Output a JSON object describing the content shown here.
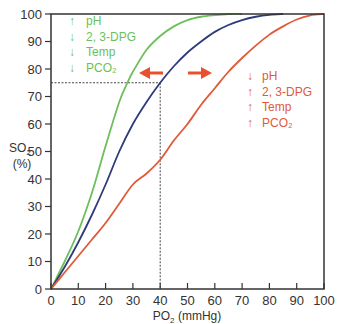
{
  "chart_data": {
    "type": "line",
    "title": "",
    "xlabel": "PO2 (mmHg)",
    "ylabel": "SO2 (%)",
    "xlim": [
      0,
      100
    ],
    "ylim": [
      0,
      100
    ],
    "xticks": [
      0,
      10,
      20,
      30,
      40,
      50,
      60,
      70,
      80,
      90,
      100
    ],
    "yticks": [
      0,
      10,
      20,
      30,
      40,
      50,
      60,
      70,
      80,
      90,
      100
    ],
    "grid": false,
    "legend": "none",
    "series": [
      {
        "name": "Left-shifted curve",
        "color": "#6cbf5a",
        "x": [
          0,
          5,
          10,
          15,
          20,
          25,
          28,
          30,
          35,
          40,
          45,
          50,
          55,
          60,
          65,
          70
        ],
        "y": [
          0,
          10,
          21,
          35,
          52,
          68,
          75,
          79,
          87,
          92,
          95.5,
          97.8,
          99,
          99.6,
          100,
          100
        ]
      },
      {
        "name": "Normal curve",
        "color": "#2e3a7a",
        "x": [
          0,
          5,
          10,
          15,
          20,
          25,
          30,
          35,
          40,
          45,
          50,
          55,
          60,
          65,
          70,
          75,
          80,
          85
        ],
        "y": [
          0,
          8,
          17,
          27,
          38,
          50,
          60,
          68,
          75,
          81,
          86,
          90,
          93.5,
          96,
          97.8,
          99,
          99.7,
          100
        ]
      },
      {
        "name": "Right-shifted curve",
        "color": "#e05a3a",
        "x": [
          0,
          5,
          10,
          15,
          20,
          25,
          30,
          35,
          40,
          45,
          50,
          55,
          60,
          65,
          70,
          75,
          80,
          85,
          90,
          95,
          100
        ],
        "y": [
          0,
          6,
          12,
          18,
          24,
          31,
          38,
          42,
          47,
          54,
          60,
          67,
          73,
          79,
          84,
          88.5,
          92.5,
          95.5,
          98,
          99.5,
          100
        ]
      }
    ],
    "annotations": {
      "reference_line": {
        "x": 40,
        "y": 75,
        "style": "dotted"
      },
      "left_shift": {
        "color": "#6cbf5a",
        "items": [
          {
            "arrow": "↑",
            "label": "pH"
          },
          {
            "arrow": "↓",
            "label": "2, 3-DPG"
          },
          {
            "arrow": "↓",
            "label": "Temp"
          },
          {
            "arrow": "↓",
            "label": "PCO₂"
          }
        ]
      },
      "right_shift": {
        "color": "#e05a3a",
        "items": [
          {
            "arrow": "↓",
            "label": "pH"
          },
          {
            "arrow": "↑",
            "label": "2, 3-DPG"
          },
          {
            "arrow": "↑",
            "label": "Temp"
          },
          {
            "arrow": "↑",
            "label": "PCO₂"
          }
        ]
      },
      "shift_arrows": {
        "color": "#e8502e",
        "left": "←",
        "right": "→"
      }
    }
  },
  "labels": {
    "x_axis_main": "PO",
    "x_axis_sub": "2",
    "x_axis_unit": " (mmHg)",
    "y_axis_main": "SO",
    "y_axis_sub": "2",
    "y_axis_unit": "(%)"
  }
}
